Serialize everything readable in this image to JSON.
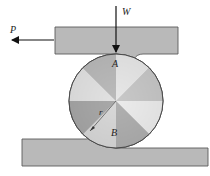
{
  "figure": {
    "labels": {
      "force_horizontal": "P",
      "force_vertical": "W",
      "contact_top": "A",
      "contact_bottom": "B",
      "radius": "r"
    },
    "colors": {
      "plate_fill": "#b8b8b8",
      "plate_stroke": "#5a5a5a",
      "arrow": "#111111",
      "cylinder_light": "#f4f4f4",
      "cylinder_dark": "#8a8a8a"
    }
  }
}
